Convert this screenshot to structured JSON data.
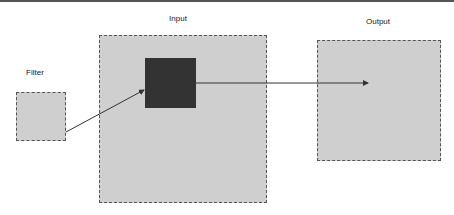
{
  "diagram": {
    "labels": {
      "input": "Input",
      "filter": "Filter",
      "output": "Output"
    },
    "nodes": [
      {
        "id": "filter",
        "label": "Filter",
        "x": 16,
        "y": 92,
        "w": 50,
        "h": 49
      },
      {
        "id": "input",
        "label": "Input",
        "x": 99,
        "y": 35,
        "w": 168,
        "h": 168
      },
      {
        "id": "receptive-field",
        "label": "",
        "x": 145,
        "y": 58,
        "w": 51,
        "h": 50
      },
      {
        "id": "output",
        "label": "Output",
        "x": 317,
        "y": 40,
        "w": 124,
        "h": 121
      }
    ],
    "edges": [
      {
        "from": "filter",
        "to": "receptive-field"
      },
      {
        "from": "receptive-field",
        "to": "output"
      }
    ],
    "colors": {
      "box_fill": "#cfcfcf",
      "box_border": "#555555",
      "kernel_fill": "#333333",
      "arrow": "#333333"
    }
  }
}
